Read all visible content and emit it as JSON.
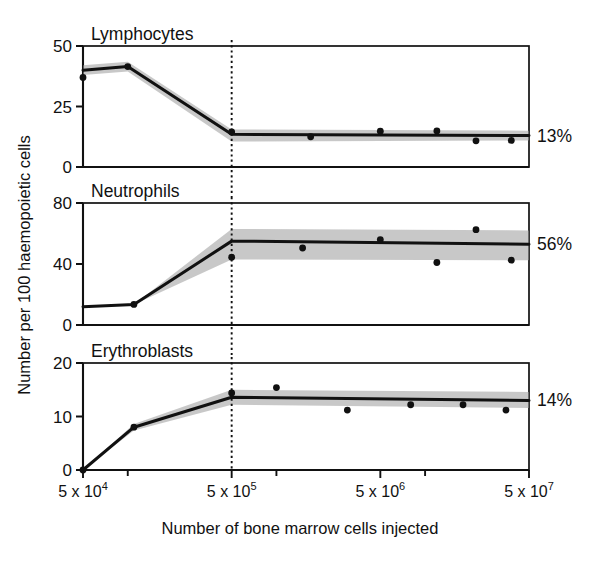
{
  "figure": {
    "y_axis_title": "Number per 100 haemopoietic cells",
    "x_axis_title": "Number of bone marrow cells injected"
  },
  "x_ticks": [
    {
      "label_base": "5 x 10",
      "exponent": "4",
      "value": 50000
    },
    {
      "label_base": "5 x 10",
      "exponent": "5",
      "value": 500000
    },
    {
      "label_base": "5 x 10",
      "exponent": "6",
      "value": 5000000
    },
    {
      "label_base": "5 x 10",
      "exponent": "7",
      "value": 50000000
    }
  ],
  "reference_line": {
    "name": "dotted-reference-line",
    "x_value": 500000,
    "style": "dotted"
  },
  "colors": {
    "line": "#111111",
    "band": "#9a9a9a",
    "point": "#111111",
    "frame": "#111111",
    "background": "#ffffff"
  },
  "chart_data": {
    "type": "line",
    "title": "",
    "xlabel": "Number of bone marrow cells injected",
    "ylabel": "Number per 100 haemopoietic cells",
    "xscale": "log",
    "xlim": [
      50000,
      50000000
    ],
    "grid": false,
    "legend": "none",
    "panels": [
      {
        "name": "lymphocytes-panel",
        "title": "Lymphocytes",
        "plateau_label": "13%",
        "ylim": [
          0,
          50
        ],
        "yticks": [
          0,
          25,
          50
        ],
        "ytick_labels": [
          "0",
          "25",
          "50"
        ],
        "trend": {
          "name": "lymphocytes-trend-line",
          "x": [
            50000,
            100000,
            500000,
            50000000
          ],
          "y": [
            40.0,
            41.5,
            13.5,
            13.0
          ]
        },
        "band": {
          "name": "lymphocytes-confidence-band",
          "x": [
            50000,
            100000,
            500000,
            50000000
          ],
          "upper": [
            42.0,
            43.5,
            15.5,
            15.0
          ],
          "lower": [
            38.0,
            39.5,
            10.5,
            11.0
          ]
        },
        "points": {
          "name": "lymphocytes-data-points",
          "x": [
            50000,
            100000,
            500000,
            1700000,
            5000000,
            12000000,
            22000000,
            38000000
          ],
          "y": [
            37.0,
            41.5,
            14.5,
            12.5,
            14.8,
            14.9,
            10.8,
            11.0
          ]
        }
      },
      {
        "name": "neutrophils-panel",
        "title": "Neutrophils",
        "plateau_label": "56%",
        "ylim": [
          0,
          80
        ],
        "yticks": [
          0,
          40,
          80
        ],
        "ytick_labels": [
          "0",
          "40",
          "80"
        ],
        "trend": {
          "name": "neutrophils-trend-line",
          "x": [
            50000,
            110000,
            500000,
            50000000
          ],
          "y": [
            12.0,
            13.5,
            55.0,
            53.0
          ]
        },
        "band": {
          "name": "neutrophils-confidence-band",
          "x": [
            50000,
            110000,
            500000,
            50000000
          ],
          "upper": [
            12.0,
            13.5,
            63.0,
            62.0
          ],
          "lower": [
            12.0,
            13.5,
            43.0,
            42.5
          ]
        },
        "points": {
          "name": "neutrophils-data-points",
          "x": [
            110000,
            500000,
            1500000,
            5000000,
            12000000,
            22000000,
            38000000
          ],
          "y": [
            13.5,
            44.5,
            50.5,
            56.0,
            41.0,
            62.5,
            42.5
          ]
        }
      },
      {
        "name": "erythroblasts-panel",
        "title": "Erythroblasts",
        "plateau_label": "14%",
        "ylim": [
          0,
          20
        ],
        "yticks": [
          0,
          10,
          20
        ],
        "ytick_labels": [
          "0",
          "10",
          "20"
        ],
        "trend": {
          "name": "erythroblasts-trend-line",
          "x": [
            50000,
            110000,
            500000,
            50000000
          ],
          "y": [
            0.0,
            8.0,
            13.6,
            13.0
          ]
        },
        "band": {
          "name": "erythroblasts-confidence-band",
          "x": [
            50000,
            110000,
            500000,
            50000000
          ],
          "upper": [
            0.0,
            8.6,
            15.0,
            14.6
          ],
          "lower": [
            0.0,
            7.4,
            12.2,
            11.6
          ]
        },
        "points": {
          "name": "erythroblasts-data-points",
          "x": [
            50000,
            110000,
            500000,
            1000000,
            3000000,
            8000000,
            18000000,
            35000000
          ],
          "y": [
            0.0,
            8.0,
            14.4,
            15.4,
            11.2,
            12.2,
            12.2,
            11.2
          ]
        }
      }
    ]
  }
}
